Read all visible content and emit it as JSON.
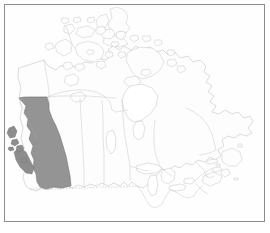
{
  "figure": {
    "kind": "thematic-map",
    "projection_note": "Lambert conformal style outline map",
    "background_color": "#ffffff",
    "frame_color": "#8d8d8d"
  },
  "map": {
    "title": "",
    "country": "Canada",
    "outline_color": "#b9b9b9",
    "province_border_color": "#c3c3c3",
    "international_border_style": "dashed",
    "international_border_color": "#b0b0b0",
    "land_fill": "#fdfdfd",
    "water_fill": "#ffffff"
  },
  "highlight": {
    "region": "British Columbia",
    "fill_color": "#949494",
    "stroke_color": "#6f6f6f",
    "label": "",
    "includes_islands": [
      "Vancouver Island",
      "Haida Gwaii"
    ]
  },
  "regions": [
    {
      "name": "British Columbia",
      "highlighted": true
    },
    {
      "name": "Yukon",
      "highlighted": false
    },
    {
      "name": "Northwest Territories",
      "highlighted": false
    },
    {
      "name": "Nunavut",
      "highlighted": false
    },
    {
      "name": "Alberta",
      "highlighted": false
    },
    {
      "name": "Saskatchewan",
      "highlighted": false
    },
    {
      "name": "Manitoba",
      "highlighted": false
    },
    {
      "name": "Ontario",
      "highlighted": false
    },
    {
      "name": "Quebec",
      "highlighted": false
    },
    {
      "name": "New Brunswick",
      "highlighted": false
    },
    {
      "name": "Nova Scotia",
      "highlighted": false
    },
    {
      "name": "Prince Edward Island",
      "highlighted": false
    },
    {
      "name": "Newfoundland and Labrador",
      "highlighted": false
    }
  ],
  "water_bodies": [
    "Hudson Bay",
    "James Bay",
    "Great Bear Lake",
    "Great Slave Lake",
    "Lake Winnipeg",
    "Lake Superior",
    "Lake Huron",
    "Lake Erie",
    "Lake Ontario",
    "Gulf of St. Lawrence"
  ],
  "legend": {
    "visible": false,
    "entries": []
  },
  "annotations": []
}
